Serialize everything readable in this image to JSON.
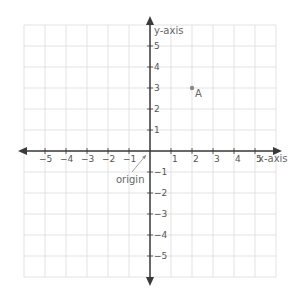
{
  "chart_data": {
    "type": "scatter",
    "title": "",
    "xlabel": "x-axis",
    "ylabel": "y-axis",
    "xlim": [
      -6,
      6
    ],
    "ylim": [
      -6,
      6
    ],
    "grid": true,
    "x_ticks": [
      -5,
      -4,
      -3,
      -2,
      -1,
      1,
      2,
      3,
      4,
      5
    ],
    "y_ticks": [
      5,
      4,
      3,
      2,
      1,
      -1,
      -2,
      -3,
      -4,
      -5
    ],
    "points": [
      {
        "label": "A",
        "x": 2,
        "y": 3
      }
    ],
    "annotations": [
      {
        "text": "origin",
        "points_to": [
          0,
          0
        ]
      }
    ]
  },
  "labels": {
    "x_axis": "x-axis",
    "y_axis": "y-axis",
    "origin": "origin",
    "point_a": "A"
  },
  "colors": {
    "grid": "#dcdcdc",
    "axis": "#3a3a3a",
    "point": "#888888",
    "text": "#555555"
  }
}
